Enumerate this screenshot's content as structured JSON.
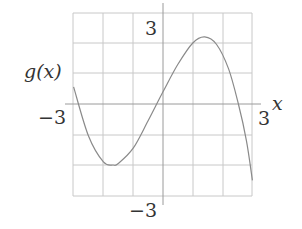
{
  "chart_data": {
    "type": "line",
    "title": "",
    "xlabel": "x",
    "ylabel": "g(x)",
    "xlim": [
      -3,
      3
    ],
    "ylim": [
      -3,
      3
    ],
    "grid": true,
    "grid_step": 1,
    "tick_labels": {
      "x_min": "−3",
      "x_max": "3",
      "y_max": "3",
      "y_min": "−3"
    },
    "series": [
      {
        "name": "g(x)",
        "x": [
          -3.0,
          -2.5,
          -2.0,
          -1.67,
          -1.5,
          -1.0,
          -0.5,
          0.0,
          0.5,
          1.0,
          1.4,
          1.8,
          2.2,
          2.53,
          2.8,
          3.0
        ],
        "y": [
          0.56,
          -1.05,
          -1.9,
          -2.0,
          -1.95,
          -1.45,
          -0.55,
          0.4,
          1.3,
          2.0,
          2.2,
          1.95,
          1.15,
          0.0,
          -1.2,
          -2.5
        ]
      }
    ],
    "features": {
      "local_min": {
        "x": -1.67,
        "y": -2.0
      },
      "local_max": {
        "x": 1.4,
        "y": 2.2
      },
      "x_intercepts": [
        -0.1,
        2.53
      ],
      "y_intercept": 0.4
    },
    "colors": {
      "curve": "#8a8a8a",
      "grid": "#c8c8c8",
      "axis": "#9a9a9a",
      "text": "#333333"
    }
  },
  "labels": {
    "y_axis": "g(x)",
    "x_axis": "x",
    "x_min": "−3",
    "x_max": "3",
    "y_max": "3",
    "y_min": "−3"
  }
}
